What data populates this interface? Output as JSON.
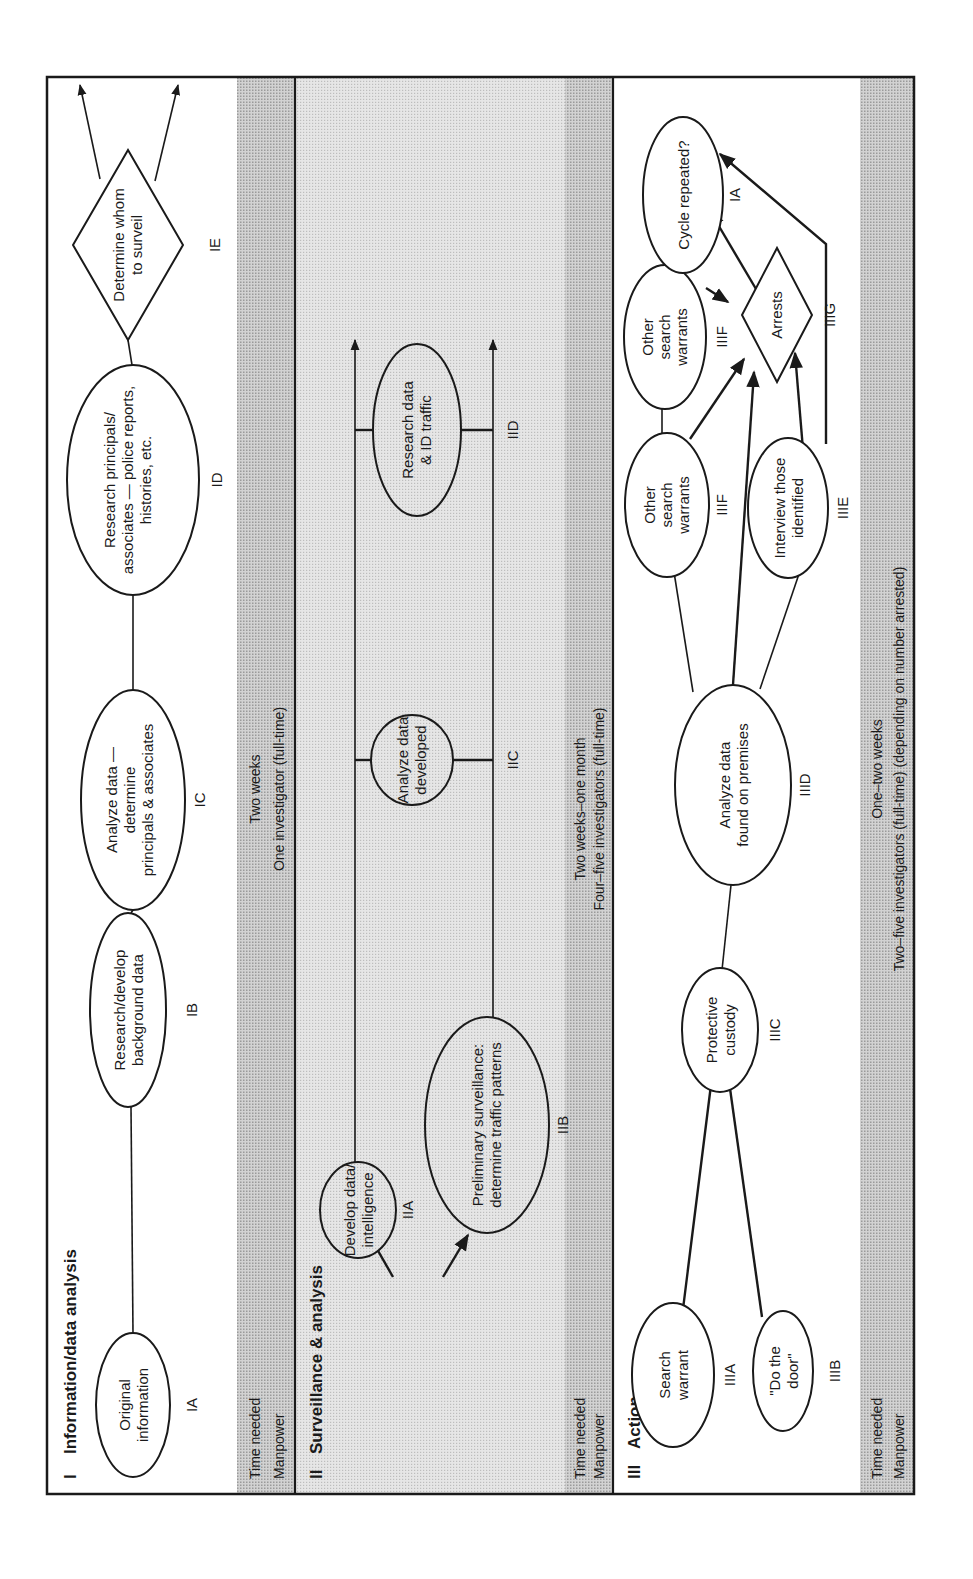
{
  "diagram": {
    "orientation": "rotated 90 degrees counter-clockwise",
    "sections": [
      {
        "numeral": "I",
        "title": "Information/data analysis",
        "time_label": "Time needed",
        "manpower_label": "Manpower",
        "time_value": "Two weeks",
        "manpower_value": "One investigator (full-time)"
      },
      {
        "numeral": "II",
        "title": "Surveillance & analysis",
        "time_label": "Time needed",
        "manpower_label": "Manpower",
        "time_value": "Two weeks–one month",
        "manpower_value": "Four–five investigators (full-time)"
      },
      {
        "numeral": "III",
        "title": "Action",
        "time_label": "Time needed",
        "manpower_label": "Manpower",
        "time_value": "One–two weeks",
        "manpower_value": "Two–five investigators (full-time) (depending on number arrested)"
      }
    ],
    "nodes": {
      "IA": {
        "code": "IA",
        "shape": "oval",
        "lines": [
          "Original",
          "information"
        ]
      },
      "IB": {
        "code": "IB",
        "shape": "oval",
        "lines": [
          "Research/develop",
          "background data"
        ]
      },
      "IC": {
        "code": "IC",
        "shape": "oval",
        "lines": [
          "Analyze data —",
          "determine",
          "principals & associates"
        ]
      },
      "ID": {
        "code": "ID",
        "shape": "oval",
        "lines": [
          "Research principals/",
          "associates — police reports,",
          "histories, etc."
        ]
      },
      "IE": {
        "code": "IE",
        "shape": "diamond",
        "lines": [
          "Determine whom",
          "to surveil"
        ]
      },
      "IIA": {
        "code": "IIA",
        "shape": "oval",
        "lines": [
          "Develop data/",
          "intelligence"
        ]
      },
      "IIB": {
        "code": "IIB",
        "shape": "oval",
        "lines": [
          "Preliminary surveillance:",
          "determine traffic patterns"
        ]
      },
      "IIC": {
        "code": "IIC",
        "shape": "oval",
        "lines": [
          "Analyze data",
          "developed"
        ]
      },
      "IID": {
        "code": "IID",
        "shape": "oval",
        "lines": [
          "Research data",
          "& ID traffic"
        ]
      },
      "IIIA": {
        "code": "IIIA",
        "shape": "oval",
        "lines": [
          "Search",
          "warrant"
        ]
      },
      "IIIB": {
        "code": "IIIB",
        "shape": "oval",
        "lines": [
          "\"Do the",
          "door\""
        ]
      },
      "IIIC": {
        "code": "IIIC",
        "shape": "oval",
        "lines": [
          "Protective",
          "custody"
        ]
      },
      "IIID": {
        "code": "IIID",
        "shape": "oval",
        "lines": [
          "Analyze data",
          "found on premises"
        ]
      },
      "IIIE": {
        "code": "IIIE",
        "shape": "oval",
        "lines": [
          "Interview those",
          "identified"
        ]
      },
      "IIIF1": {
        "code": "IIIF",
        "shape": "oval",
        "lines": [
          "Other",
          "search",
          "warrants"
        ]
      },
      "IIIF2": {
        "code": "IIIF",
        "shape": "oval",
        "lines": [
          "Other",
          "search",
          "warrants"
        ]
      },
      "IIIG": {
        "code": "IIIG",
        "shape": "diamond",
        "lines": [
          "Arrests"
        ]
      },
      "CYCLE": {
        "code": "IA",
        "shape": "oval",
        "lines": [
          "Cycle repeated?"
        ]
      }
    },
    "edges": [
      [
        "IA",
        "IB"
      ],
      [
        "IB",
        "IC"
      ],
      [
        "IC",
        "ID"
      ],
      [
        "ID",
        "IE"
      ],
      [
        "IE",
        "exit-1"
      ],
      [
        "IE",
        "exit-2"
      ],
      [
        "entry-1",
        "IIA"
      ],
      [
        "entry-2",
        "IIB"
      ],
      [
        "IIA",
        "exit-track-1"
      ],
      [
        "IIB",
        "exit-track-2"
      ],
      [
        "IIC",
        "track-1"
      ],
      [
        "IIC",
        "track-2"
      ],
      [
        "IID",
        "track-1"
      ],
      [
        "IID",
        "track-2"
      ],
      [
        "IIIA",
        "IIIC"
      ],
      [
        "IIIB",
        "IIIC"
      ],
      [
        "IIIC",
        "IIID"
      ],
      [
        "IIID",
        "IIIF1"
      ],
      [
        "IIID",
        "IIIE"
      ],
      [
        "IIID",
        "IIIG"
      ],
      [
        "IIIF1",
        "IIIF2"
      ],
      [
        "IIIF1",
        "IIIG"
      ],
      [
        "IIIF2",
        "IIIG"
      ],
      [
        "IIIE",
        "IIIG"
      ],
      [
        "IIIE",
        "CYCLE"
      ],
      [
        "IIIG",
        "CYCLE"
      ],
      [
        "IIIF2",
        "CYCLE"
      ]
    ]
  }
}
